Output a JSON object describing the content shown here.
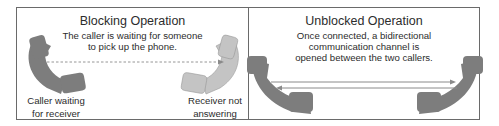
{
  "blocking": {
    "title": "Blocking Operation",
    "description_line1": "The caller is waiting for someone",
    "description_line2": "to pick up the phone.",
    "caller_label_line1": "Caller waiting",
    "caller_label_line2": "for receiver",
    "receiver_label_line1": "Receiver not",
    "receiver_label_line2": "answering",
    "caller_color": "#7d7d7d",
    "receiver_color": "#c4c4c4",
    "connection_style": "dashed one-way arrow"
  },
  "unblocked": {
    "title": "Unblocked Operation",
    "description_line1": "Once connected, a bidirectional",
    "description_line2": "communication channel is",
    "description_line3": "opened between the two callers.",
    "handset_color": "#7d7d7d",
    "connection_style": "solid bidirectional arrows"
  }
}
